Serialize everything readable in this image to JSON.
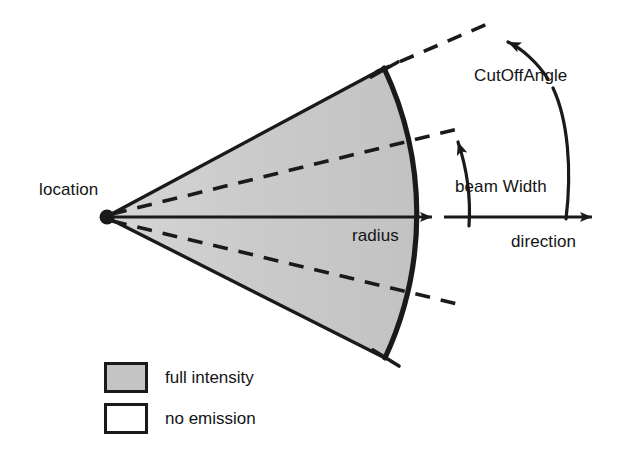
{
  "figure": {
    "labels": {
      "location": "location",
      "radius": "radius",
      "direction": "direction",
      "cut_off_angle": "CutOffAngle",
      "beam_width": "beam Width"
    },
    "legend": {
      "items": [
        {
          "label": "full intensity",
          "swatch": "filled",
          "color": "#c4c4c4"
        },
        {
          "label": "no emission",
          "swatch": "empty",
          "color": "#ffffff"
        }
      ]
    },
    "colors": {
      "stroke": "#1a1a1a",
      "fill_full_intensity": "#c4c4c4",
      "fill_no_emission": "#ffffff",
      "background": "#ffffff",
      "text": "#141414"
    },
    "geometry": {
      "apex": {
        "x": 106,
        "y": 217
      },
      "axis_arrow_radius_end": {
        "x": 432,
        "y": 217
      },
      "axis_arrow_direction_end": {
        "x": 592,
        "y": 217
      },
      "arc_radius": 342,
      "cone_upper_edge_end": {
        "x": 384,
        "y": 68
      },
      "cone_lower_edge_end": {
        "x": 385,
        "y": 358
      },
      "beam_width_dash_end": {
        "x": 462,
        "y": 128
      },
      "cut_off_dash_end": {
        "x": 492,
        "y": 22
      }
    }
  }
}
